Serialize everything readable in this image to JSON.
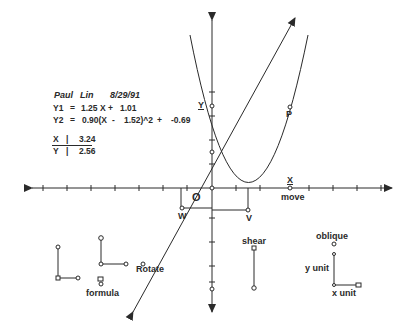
{
  "header": {
    "author_first": "Paul",
    "author_last": "Lin",
    "date": "8/29/91"
  },
  "equations": {
    "y1": {
      "name": "Y1",
      "eq": "=",
      "expr": "1.25 X",
      "plus": "+",
      "const": "1.01"
    },
    "y2": {
      "name": "Y2",
      "eq": "=",
      "expr": "0.90(X",
      "minus": "-",
      "shift": "1.52)^2",
      "plus": "+",
      "const": "-0.69"
    }
  },
  "readout": {
    "x_label": "X",
    "x_sep": "|",
    "x_value": "3.24",
    "y_label": "Y",
    "y_sep": "|",
    "y_value": "2.56"
  },
  "axes": {
    "x_axis_label": "X",
    "y_axis_label": "Y",
    "origin_label": "O"
  },
  "points": {
    "p": "P",
    "w": "W",
    "v": "V",
    "move": "move"
  },
  "controls": {
    "rotate": "Rotate",
    "formula": "formula",
    "shear": "shear",
    "oblique": "oblique",
    "y_unit": "y  unit",
    "x_unit": "x  unit"
  },
  "colors": {
    "ink": "#2a2a2a",
    "background": "#ffffff"
  }
}
